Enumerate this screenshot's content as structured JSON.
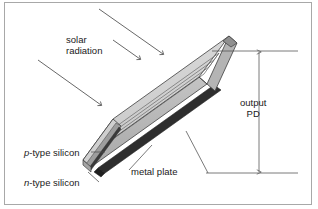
{
  "figure": {
    "background_color": "#ffffff",
    "border_color": "#a8a8a8",
    "line_color": "#4d4d4d",
    "text_color": "#1a1a1a"
  },
  "labels": {
    "solar_line1": "solar",
    "solar_line2": "radiation",
    "output_line1": "output",
    "output_line2": "PD",
    "ptype_prefix": "p",
    "ptype_rest": "-type silicon",
    "ntype_prefix": "n",
    "ntype_rest": "-type silicon",
    "metal_plate": "metal plate"
  },
  "panel": {
    "top_face_color": "#d2d2d2",
    "front_face_color": "#bcbcbc",
    "end_cap_color": "#c8c8c8",
    "end_cap_dark_color": "#9a9a9a",
    "metal_plate_color": "#2e2e2e",
    "groove_color": "#6b6b6b",
    "outline_color": "#3d3d3d",
    "groove_count": 4
  },
  "arrows": {
    "radiation_count": 3,
    "dimension_style": "double-headed-vertical"
  }
}
